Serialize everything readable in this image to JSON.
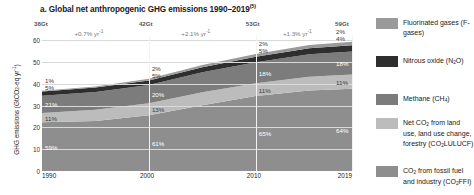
{
  "panel": {
    "label": "a.",
    "title": "a. Global net anthropogenic GHG emissions 1990–2019",
    "superscript": "(5)"
  },
  "axes": {
    "y_title": "GHG emissions (GtCO₂-eq yr⁻¹)",
    "y_ticks": [
      "0",
      "10",
      "20",
      "30",
      "40",
      "50",
      "60"
    ],
    "y_min": 0,
    "y_max": 62,
    "x_ticks": [
      "1990",
      "2000",
      "2010",
      "2019"
    ],
    "x_min": 1990,
    "x_max": 2019
  },
  "annotations": {
    "totals": [
      {
        "label": "38Gt",
        "year": 1990
      },
      {
        "label": "42Gt",
        "year": 2000
      },
      {
        "label": "53Gt",
        "year": 2010
      },
      {
        "label": "59Gt",
        "year": 2019
      }
    ],
    "rates": [
      {
        "label": "+0.7% yr⁻¹",
        "from": 1990,
        "to": 2000
      },
      {
        "label": "+2.1% yr⁻¹",
        "from": 2000,
        "to": 2010
      },
      {
        "label": "+1.3% yr⁻¹",
        "from": 2010,
        "to": 2019
      }
    ]
  },
  "legend": {
    "items": [
      {
        "name": "f-gases",
        "label": "Fluorinated gases (F-gases)",
        "color": "#9a9a9a"
      },
      {
        "name": "n2o",
        "label": "Nitrous oxide (N₂O)",
        "color": "#2e2e2e"
      },
      {
        "name": "ch4",
        "label": "Methane (CH₄)",
        "color": "#7c7c7c"
      },
      {
        "name": "co2-lulucf",
        "label": "Net CO₂ from land use, land use change, forestry (CO₂LULUCF)",
        "color": "#bcbcbc"
      },
      {
        "name": "co2-ffi",
        "label": "CO₂ from fossil fuel and industry (CO₂FFI)",
        "color": "#8e8e8e"
      }
    ]
  },
  "chart_data": {
    "type": "area",
    "title": "Global net anthropogenic GHG emissions 1990–2019",
    "xlabel": "",
    "ylabel": "GHG emissions (GtCO₂-eq yr⁻¹)",
    "ylim": [
      0,
      62
    ],
    "xlim": [
      1990,
      2019
    ],
    "grid": true,
    "legend_position": "right",
    "stacked": true,
    "x": [
      1990,
      1995,
      2000,
      2005,
      2010,
      2015,
      2019
    ],
    "series": [
      {
        "name": "CO₂ from fossil fuel and industry (CO₂FFI)",
        "color": "#8e8e8e",
        "values": [
          22.4,
          23.0,
          25.6,
          30.2,
          34.5,
          37.0,
          37.8
        ]
      },
      {
        "name": "Net CO₂ from land use, land use change, forestry (CO₂LULUCF)",
        "color": "#bcbcbc",
        "values": [
          4.2,
          5.1,
          5.5,
          6.0,
          5.8,
          6.3,
          6.5
        ]
      },
      {
        "name": "Methane (CH₄)",
        "color": "#7c7c7c",
        "values": [
          8.0,
          8.2,
          8.4,
          9.1,
          9.6,
          10.3,
          10.6
        ]
      },
      {
        "name": "Nitrous oxide (N₂O)",
        "color": "#2e2e2e",
        "values": [
          1.9,
          2.0,
          2.1,
          2.4,
          2.6,
          2.8,
          2.8
        ]
      },
      {
        "name": "Fluorinated gases (F-gases)",
        "color": "#9a9a9a",
        "values": [
          0.4,
          0.5,
          0.8,
          1.0,
          1.2,
          1.5,
          1.7
        ]
      }
    ],
    "share_labels": [
      {
        "year": 1990,
        "series": "f-gases",
        "label": "1%"
      },
      {
        "year": 1990,
        "series": "n2o",
        "label": "5%"
      },
      {
        "year": 1990,
        "series": "ch4",
        "label": "21%"
      },
      {
        "year": 1990,
        "series": "co2-lulucf",
        "label": "11%"
      },
      {
        "year": 1990,
        "series": "co2-ffi",
        "label": "59%"
      },
      {
        "year": 2000,
        "series": "f-gases",
        "label": "2%"
      },
      {
        "year": 2000,
        "series": "n2o",
        "label": "5%"
      },
      {
        "year": 2000,
        "series": "ch4",
        "label": "20%"
      },
      {
        "year": 2000,
        "series": "co2-lulucf",
        "label": "13%"
      },
      {
        "year": 2000,
        "series": "co2-ffi",
        "label": "61%"
      },
      {
        "year": 2010,
        "series": "f-gases",
        "label": "2%"
      },
      {
        "year": 2010,
        "series": "n2o",
        "label": "5%"
      },
      {
        "year": 2010,
        "series": "ch4",
        "label": "18%"
      },
      {
        "year": 2010,
        "series": "co2-lulucf",
        "label": "11%"
      },
      {
        "year": 2010,
        "series": "co2-ffi",
        "label": "65%"
      },
      {
        "year": 2019,
        "series": "f-gases",
        "label": "2%"
      },
      {
        "year": 2019,
        "series": "n2o",
        "label": "4%"
      },
      {
        "year": 2019,
        "series": "ch4",
        "label": "18%"
      },
      {
        "year": 2019,
        "series": "co2-lulucf",
        "label": "11%"
      },
      {
        "year": 2019,
        "series": "co2-ffi",
        "label": "64%"
      }
    ]
  }
}
